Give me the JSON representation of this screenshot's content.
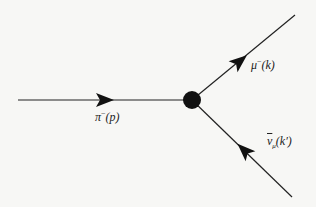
{
  "diagram": {
    "type": "feynman-diagram",
    "vertex": {
      "x": 192,
      "y": 100,
      "r": 9,
      "color": "#111111"
    },
    "lines": [
      {
        "name": "pion-line",
        "from": [
          18,
          100
        ],
        "to": [
          192,
          100
        ],
        "arrow_at": [
          103,
          100
        ],
        "arrow_dir": "in"
      },
      {
        "name": "muon-line",
        "from": [
          192,
          100
        ],
        "to": [
          295,
          15
        ],
        "arrow_at": [
          237,
          63
        ],
        "arrow_dir": "out"
      },
      {
        "name": "antineutrino-line",
        "from": [
          292,
          197
        ],
        "to": [
          192,
          100
        ],
        "arrow_at": [
          243,
          150
        ],
        "arrow_dir": "in"
      }
    ],
    "labels": {
      "pion": {
        "base": "π",
        "sup": "−",
        "arg": "(p)"
      },
      "muon": {
        "base": "μ",
        "sup": "−",
        "arg": "(k)"
      },
      "antineutrino": {
        "base": "ν",
        "sub": "μ",
        "arg": "(k′)"
      }
    },
    "line_color": "#222222"
  }
}
